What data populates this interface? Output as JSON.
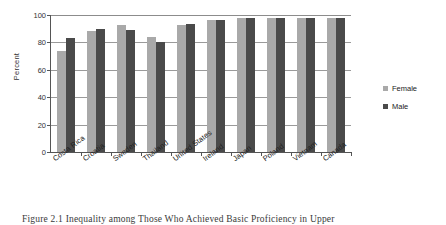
{
  "chart_data": {
    "type": "bar",
    "title": "",
    "xlabel": "",
    "ylabel": "Percent",
    "ylim": [
      0,
      100
    ],
    "yticks": [
      0,
      20,
      40,
      60,
      80,
      100
    ],
    "grid": true,
    "legend_position": "right",
    "categories": [
      "Costa Rica",
      "Croatia",
      "Sweden",
      "Thailand",
      "United States",
      "Ireland",
      "Japan",
      "Poland",
      "Vietnam",
      "Canada"
    ],
    "series": [
      {
        "name": "Female",
        "color": "#a9a9a9",
        "values": [
          74,
          88,
          93,
          84,
          93,
          96,
          97.5,
          97.5,
          97.5,
          98
        ]
      },
      {
        "name": "Male",
        "color": "#4a4a4a",
        "values": [
          83,
          90,
          89,
          80.5,
          93.5,
          96.5,
          97.5,
          98,
          98,
          98
        ]
      }
    ]
  },
  "legend": {
    "items": [
      {
        "label": "Female",
        "color": "#a9a9a9"
      },
      {
        "label": "Male",
        "color": "#4a4a4a"
      }
    ]
  },
  "caption": {
    "text": "Figure 2.1 Inequality among Those Who Achieved Basic Proficiency in Upper"
  }
}
